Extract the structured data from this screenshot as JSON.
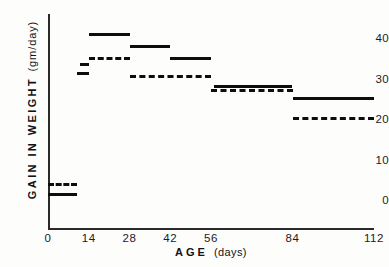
{
  "chart_data": {
    "type": "line",
    "title": "",
    "xlabel": "AGE (days)",
    "ylabel": "GAIN IN WEIGHT (gm/day)",
    "ylabel_main": "GAIN  IN  WEIGHT",
    "ylabel_unit": "(gm/day)",
    "xlabel_main": "AGE",
    "xlabel_unit": "(days)",
    "xlim": [
      0,
      112
    ],
    "ylim": [
      -2,
      46
    ],
    "xticks": [
      0,
      14,
      28,
      42,
      56,
      84,
      112
    ],
    "xticklabels": [
      "0",
      "14",
      "28",
      "42",
      "56",
      "84",
      "112"
    ],
    "yticks": [
      0,
      10,
      20,
      30,
      40
    ],
    "yticklabels": [
      "0",
      "10",
      "20",
      "30",
      "40"
    ],
    "grid": false,
    "legend": "none",
    "drawstyle": "steps",
    "series": [
      {
        "name": "solid",
        "style": "solid",
        "steps": [
          {
            "x0": 0,
            "x1": 10,
            "y": 1.8
          },
          {
            "x0": 11,
            "x1": 14,
            "y": 33.9
          },
          {
            "x0": 14,
            "x1": 28,
            "y": 41.2
          },
          {
            "x0": 28,
            "x1": 42,
            "y": 38.3
          },
          {
            "x0": 42,
            "x1": 56,
            "y": 35.3
          },
          {
            "x0": 57,
            "x1": 84,
            "y": 28.4
          },
          {
            "x0": 84,
            "x1": 112,
            "y": 25.4
          }
        ]
      },
      {
        "name": "dashed",
        "style": "dashed",
        "steps": [
          {
            "x0": 0,
            "x1": 10,
            "y": 4.3
          },
          {
            "x0": 10,
            "x1": 14,
            "y": 31.6
          },
          {
            "x0": 14,
            "x1": 28,
            "y": 35.3
          },
          {
            "x0": 28,
            "x1": 56,
            "y": 30.9
          },
          {
            "x0": 56,
            "x1": 84,
            "y": 27.3
          },
          {
            "x0": 84,
            "x1": 112,
            "y": 20.4
          }
        ]
      }
    ]
  },
  "figure": {
    "caption": ""
  }
}
